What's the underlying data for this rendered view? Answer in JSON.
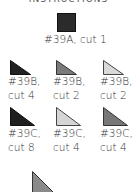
{
  "header": {
    "title": "INSTRUCTIONS"
  },
  "pieces": [
    {
      "id": "39A",
      "label": "#39A, cut 1",
      "shape": "square",
      "color": "#2b2b2b"
    },
    {
      "id": "39B-1",
      "line1": "#39B,",
      "line2": "cut 4",
      "shape": "triangle",
      "color": "#222222"
    },
    {
      "id": "39B-2",
      "line1": "#39B,",
      "line2": "cut 2",
      "shape": "triangle",
      "color": "#7a7a7a"
    },
    {
      "id": "39B-3",
      "line1": "#39B,",
      "line2": "cut 2",
      "shape": "triangle",
      "color": "#d9d9d9"
    },
    {
      "id": "39C-1",
      "line1": "#39C,",
      "line2": "cut 8",
      "shape": "triangle",
      "color": "#1e1e1e"
    },
    {
      "id": "39C-2",
      "line1": "#39C,",
      "line2": "cut 4",
      "shape": "triangle",
      "color": "#d5d5d5"
    },
    {
      "id": "39C-3",
      "line1": "#39C,",
      "line2": "cut 4",
      "shape": "triangle",
      "color": "#777777"
    },
    {
      "id": "partial",
      "shape": "triangle",
      "color": "#8a8a8a"
    }
  ]
}
